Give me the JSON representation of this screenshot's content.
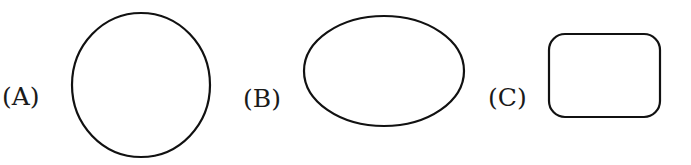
{
  "figure": {
    "stroke_color": "#111111",
    "background": "#ffffff",
    "options": [
      {
        "label": "(A)",
        "shape": "circle",
        "description": "circle"
      },
      {
        "label": "(B)",
        "shape": "ellipse",
        "description": "horizontal ellipse"
      },
      {
        "label": "(C)",
        "shape": "rounded-rectangle",
        "description": "rectangle with rounded corners"
      }
    ]
  }
}
